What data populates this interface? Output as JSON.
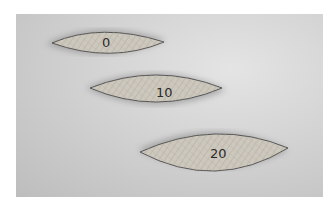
{
  "image": {
    "description": "Photograph of three wooden joinery biscuits of increasing size",
    "biscuits": [
      {
        "label": "0"
      },
      {
        "label": "10"
      },
      {
        "label": "20"
      }
    ],
    "colors": {
      "background": "#d2d2d2",
      "biscuit": "#c8c3b8",
      "shadow": "#8a8a8a",
      "text": "#2a2a2a"
    }
  }
}
